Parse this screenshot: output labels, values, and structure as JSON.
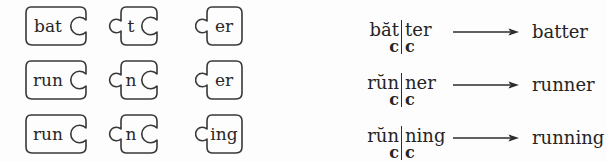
{
  "figure": {
    "background": "#fdfdfd",
    "ink": "#2d2d2d"
  },
  "puzzle": {
    "rows": [
      {
        "pieces": [
          {
            "label": "bat"
          },
          {
            "label": "t"
          },
          {
            "label": "er"
          }
        ]
      },
      {
        "pieces": [
          {
            "label": "run"
          },
          {
            "label": "n"
          },
          {
            "label": "er"
          }
        ]
      },
      {
        "pieces": [
          {
            "label": "run"
          },
          {
            "label": "n"
          },
          {
            "label": "ing"
          }
        ]
      }
    ]
  },
  "analysis": {
    "rows": [
      {
        "left_syllable": "băt",
        "left_consonant": "c",
        "right_syllable": "ter",
        "right_consonant": "c",
        "result": "batter"
      },
      {
        "left_syllable": "rŭn",
        "left_consonant": "c",
        "right_syllable": "ner",
        "right_consonant": "c",
        "result": "runner"
      },
      {
        "left_syllable": "rŭn",
        "left_consonant": "c",
        "right_syllable": "ning",
        "right_consonant": "c",
        "result": "running"
      }
    ]
  }
}
